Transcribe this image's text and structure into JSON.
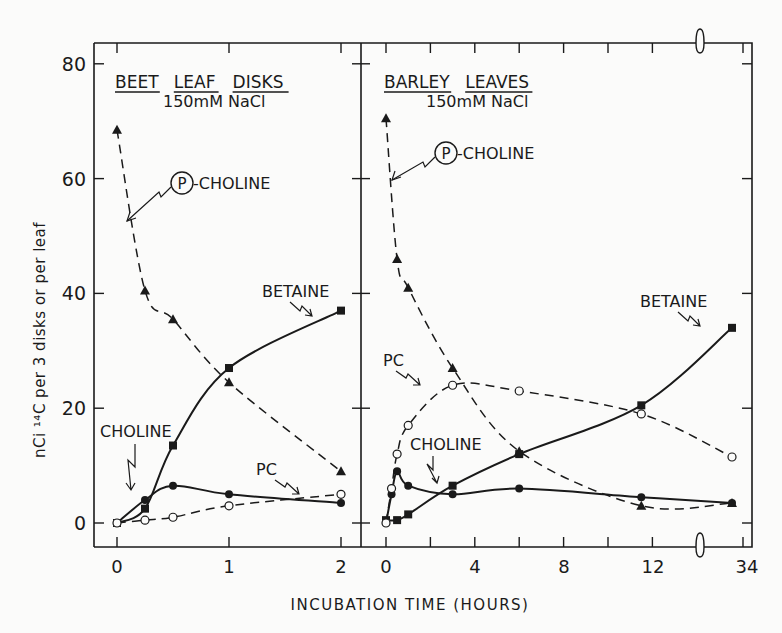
{
  "chart_data": [
    {
      "type": "line",
      "panel": "left",
      "title": "BEET LEAF DISKS",
      "subtitle": "150mM NaCl",
      "xlabel": "INCUBATION TIME (HOURS)",
      "ylabel": "nCi 14C per 3 disks or per leaf",
      "xlim": [
        0,
        2
      ],
      "ylim": [
        0,
        80
      ],
      "x_ticks": [
        0,
        1,
        2
      ],
      "x_tick_labels": [
        "0",
        "1",
        "2"
      ],
      "y_ticks": [
        0,
        20,
        40,
        60,
        80
      ],
      "y_tick_labels": [
        "0",
        "20",
        "40",
        "60",
        "80"
      ],
      "grid": false,
      "series": [
        {
          "name": "P-CHOLINE",
          "marker": "filled-triangle",
          "line": "dashed",
          "x": [
            0,
            0.25,
            0.5,
            1,
            2
          ],
          "values": [
            68.5,
            40.5,
            35.5,
            24.5,
            9
          ]
        },
        {
          "name": "BETAINE",
          "marker": "filled-square",
          "line": "solid",
          "x": [
            0,
            0.25,
            0.5,
            1,
            2
          ],
          "values": [
            0,
            2.5,
            13.5,
            27,
            37
          ]
        },
        {
          "name": "CHOLINE",
          "marker": "filled-circle",
          "line": "solid",
          "x": [
            0,
            0.25,
            0.5,
            1,
            2
          ],
          "values": [
            0,
            4,
            6.5,
            5,
            3.5
          ]
        },
        {
          "name": "PC",
          "marker": "open-circle",
          "line": "dashed",
          "x": [
            0,
            0.25,
            0.5,
            1,
            2
          ],
          "values": [
            0,
            0.5,
            1,
            3,
            5
          ]
        }
      ],
      "annotations": [
        "P-CHOLINE",
        "BETAINE",
        "CHOLINE",
        "PC"
      ]
    },
    {
      "type": "line",
      "panel": "right",
      "title": "BARLEY LEAVES",
      "subtitle": "150mM NaCl",
      "xlabel": "INCUBATION TIME (HOURS)",
      "ylabel": "nCi 14C per 3 disks or per leaf",
      "xlim": [
        0,
        34
      ],
      "x_axis_break": [
        13,
        33
      ],
      "ylim": [
        0,
        80
      ],
      "x_ticks": [
        0,
        4,
        8,
        12,
        34
      ],
      "x_tick_labels": [
        "0",
        "4",
        "8",
        "12",
        "34"
      ],
      "y_ticks": [
        0,
        20,
        40,
        60,
        80
      ],
      "grid": false,
      "series": [
        {
          "name": "P-CHOLINE",
          "marker": "filled-triangle",
          "line": "dashed",
          "x": [
            0,
            0.5,
            1,
            3,
            6,
            11.5,
            33
          ],
          "values": [
            70.5,
            46,
            41,
            27,
            12.5,
            3,
            3.5
          ]
        },
        {
          "name": "BETAINE",
          "marker": "filled-square",
          "line": "solid",
          "x": [
            0,
            0.5,
            1,
            3,
            6,
            11.5,
            33
          ],
          "values": [
            0.5,
            0.5,
            1.5,
            6.5,
            12,
            20.5,
            34
          ]
        },
        {
          "name": "CHOLINE",
          "marker": "filled-circle",
          "line": "solid",
          "x": [
            0,
            0.25,
            0.5,
            1,
            3,
            6,
            11.5,
            33
          ],
          "values": [
            0,
            5,
            9,
            6.5,
            5,
            6,
            4.5,
            3.5
          ]
        },
        {
          "name": "PC",
          "marker": "open-circle",
          "line": "dashed",
          "x": [
            0,
            0.25,
            0.5,
            1,
            3,
            6,
            11.5,
            33
          ],
          "values": [
            0,
            6,
            12,
            17,
            24,
            23,
            19,
            11.5
          ]
        }
      ],
      "annotations": [
        "P-CHOLINE",
        "BETAINE",
        "CHOLINE",
        "PC"
      ]
    }
  ],
  "labels": {
    "ylabel": "nCi ¹⁴C per 3 disks or per leaf",
    "xlabel": "INCUBATION TIME (HOURS)",
    "left_title_words": [
      "BEET",
      "LEAF",
      "DISKS"
    ],
    "left_subtitle": "150mM  NaCl",
    "right_title_words": [
      "BARLEY",
      "LEAVES"
    ],
    "right_subtitle": "150mM  NaCl",
    "p_choline_letter": "P",
    "p_choline_suffix": "-CHOLINE",
    "betaine": "BETAINE",
    "choline": "CHOLINE",
    "pc": "PC"
  },
  "colors": {
    "ink": "#1a1a1a",
    "background": "#fbfbfa"
  }
}
